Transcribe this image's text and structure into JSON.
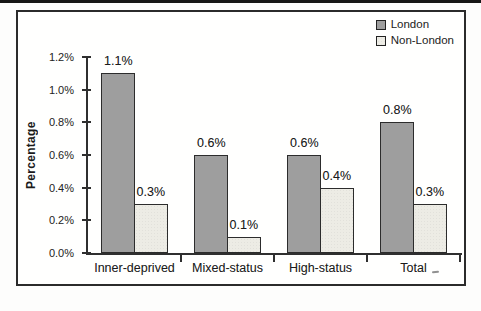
{
  "figure": {
    "kind": "scanned-bar-chart",
    "frame_border_color": "#2b2b2b",
    "background": "#fffffe",
    "axis_color": "#2f2f2f"
  },
  "chart_data": {
    "type": "bar",
    "title": "",
    "xlabel": "",
    "ylabel": "Percentage",
    "categories": [
      "Inner-deprived",
      "Mixed-status",
      "High-status",
      "Total"
    ],
    "series": [
      {
        "name": "London",
        "color": "#9e9e9e",
        "values": [
          1.1,
          0.6,
          0.6,
          0.8
        ],
        "data_labels": [
          "1.1%",
          "0.6%",
          "0.6%",
          "0.8%"
        ]
      },
      {
        "name": "Non-London",
        "color": "#edece5",
        "values": [
          0.3,
          0.1,
          0.4,
          0.3
        ],
        "data_labels": [
          "0.3%",
          "0.1%",
          "0.4%",
          "0.3%"
        ]
      }
    ],
    "ylim": [
      0,
      1.2
    ],
    "ytick_labels": [
      "0.0%",
      "0.2%",
      "0.4%",
      "0.6%",
      "0.8%",
      "1.0%",
      "1.2%"
    ],
    "grid": false,
    "legend_position": "top-right",
    "bar_value_labels_shown": true
  }
}
